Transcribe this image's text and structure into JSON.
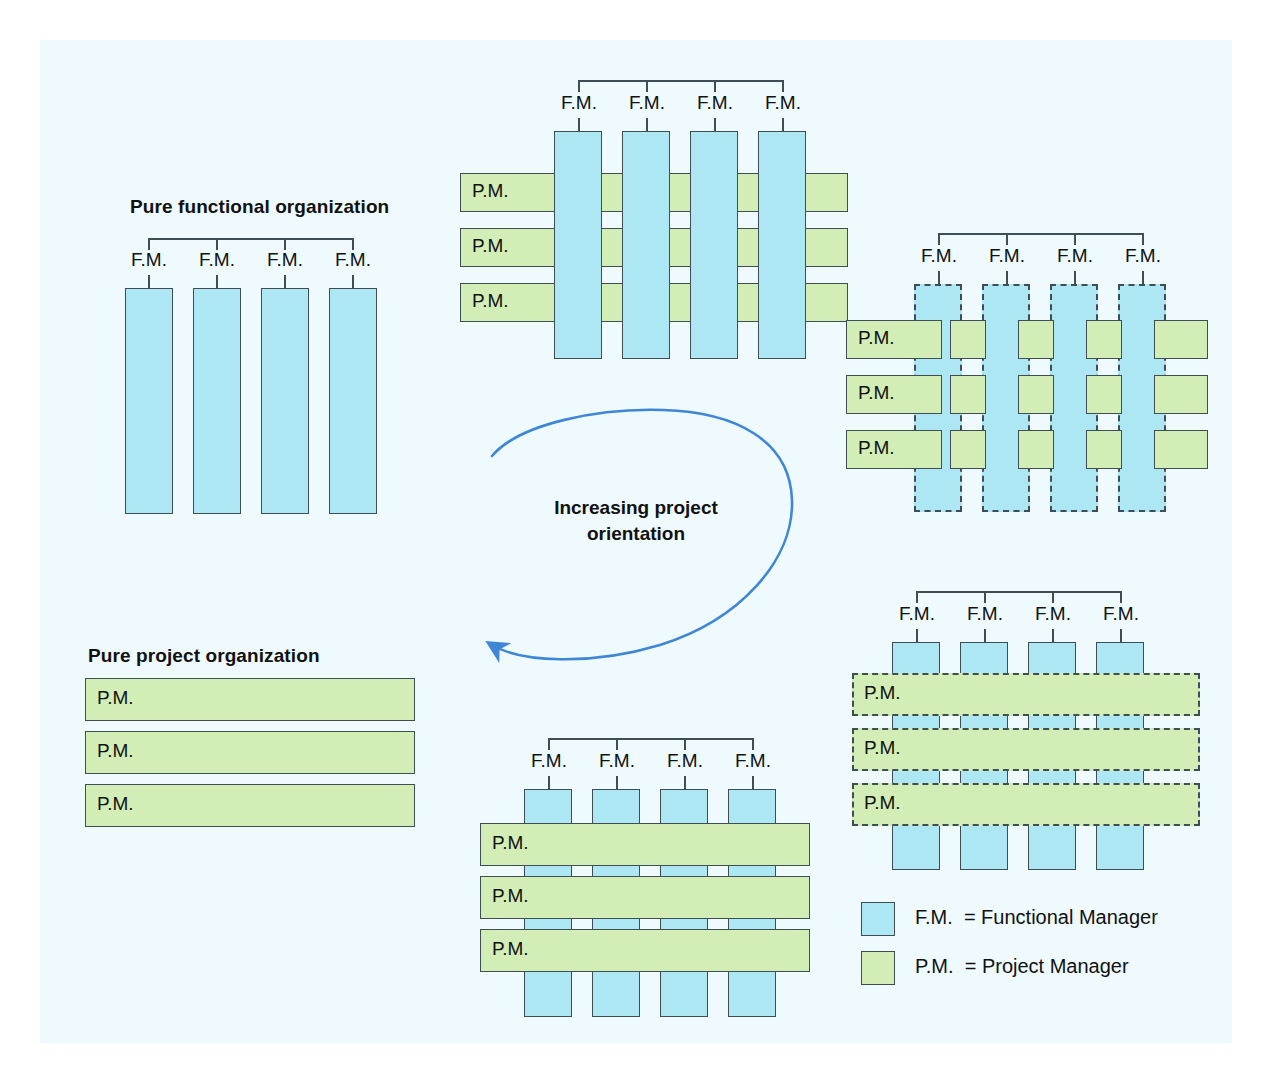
{
  "page": {
    "background_outer": "#ffffff",
    "background_inner": "#eefafd",
    "fm_color": "#ace7f3",
    "pm_color": "#d2eeb6",
    "stroke_color": "#3f4e55",
    "arrow_color": "#3f86d6"
  },
  "labels": {
    "fm": "F.M.",
    "pm": "P.M."
  },
  "titles": {
    "pure_functional": "Pure functional organization",
    "pure_project": "Pure project organization"
  },
  "center": {
    "text": "Increasing project\norientation"
  },
  "legend": {
    "items": [
      {
        "swatch": "#ace7f3",
        "abbr": "F.M.",
        "eq": "=",
        "full": "Functional Manager",
        "line": "F.M.  = Functional Manager"
      },
      {
        "swatch": "#d2eeb6",
        "abbr": "P.M.",
        "eq": "=",
        "full": "Project Manager",
        "line": "P.M.  = Project Manager"
      }
    ]
  },
  "diagrams": [
    {
      "id": "pure-functional",
      "name": "Pure functional organization",
      "fm_count": 4,
      "pm_count": 0,
      "fm_border": "solid",
      "pm_border": "none",
      "front_layer": "functional"
    },
    {
      "id": "weak-matrix",
      "name": "Functional matrix",
      "fm_count": 4,
      "pm_count": 3,
      "fm_border": "solid",
      "pm_border": "solid",
      "front_layer": "functional"
    },
    {
      "id": "balanced-matrix",
      "name": "Balanced matrix",
      "fm_count": 4,
      "pm_count": 3,
      "fm_border": "dashed",
      "pm_border": "solid",
      "front_layer": "mixed"
    },
    {
      "id": "strong-matrix",
      "name": "Project matrix",
      "fm_count": 4,
      "pm_count": 3,
      "fm_border": "solid",
      "pm_border": "dashed",
      "front_layer": "project"
    },
    {
      "id": "project-matrix-bottom",
      "name": "Project matrix",
      "fm_count": 4,
      "pm_count": 3,
      "fm_border": "solid",
      "pm_border": "solid",
      "front_layer": "project"
    },
    {
      "id": "pure-project",
      "name": "Pure project organization",
      "fm_count": 0,
      "pm_count": 3,
      "fm_border": "none",
      "pm_border": "solid",
      "front_layer": "project"
    }
  ]
}
